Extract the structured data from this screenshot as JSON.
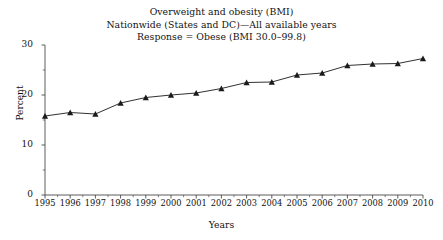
{
  "chart_data": {
    "type": "line",
    "title": "Overweight and obesity (BMI)",
    "subtitle": "Nationwide (States and DC)—All available years",
    "subtitle2": "Response = Obese (BMI 30.0–99.8)",
    "xlabel": "Years",
    "ylabel": "Percent",
    "xlim": [
      1995,
      2010
    ],
    "ylim": [
      0,
      30
    ],
    "ytick_labels": [
      "0",
      "10",
      "20",
      "30"
    ],
    "ytick_values": [
      0,
      10,
      20,
      30
    ],
    "yminor_values": [
      5,
      15,
      25
    ],
    "grid": false,
    "legend": "none",
    "marker": "triangle",
    "line_color": "#1a1a1a",
    "marker_color": "#1a1a1a",
    "categories": [
      "1995",
      "1996",
      "1997",
      "1998",
      "1999",
      "2000",
      "2001",
      "2002",
      "2003",
      "2004",
      "2005",
      "2006",
      "2007",
      "2008",
      "2009",
      "2010"
    ],
    "x": [
      1995,
      1996,
      1997,
      1998,
      1999,
      2000,
      2001,
      2002,
      2003,
      2004,
      2005,
      2006,
      2007,
      2008,
      2009,
      2010
    ],
    "values": [
      15.8,
      16.5,
      16.2,
      18.4,
      19.5,
      20.0,
      20.4,
      21.3,
      22.5,
      22.6,
      24.0,
      24.4,
      25.9,
      26.2,
      26.3,
      27.3
    ],
    "series": [
      {
        "name": "Obese (BMI 30.0–99.8)",
        "values": [
          15.8,
          16.5,
          16.2,
          18.4,
          19.5,
          20.0,
          20.4,
          21.3,
          22.5,
          22.6,
          24.0,
          24.4,
          25.9,
          26.2,
          26.3,
          27.3
        ]
      }
    ]
  }
}
